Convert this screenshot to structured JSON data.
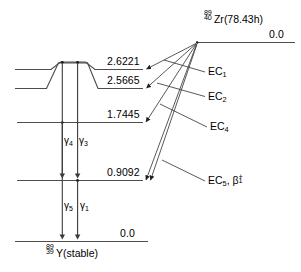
{
  "diagram": {
    "type": "nuclear-decay-scheme",
    "parent": {
      "mass_number": "89",
      "atomic_number": "40",
      "symbol": "Zr",
      "detail": "(78.43h)",
      "energy": "0.0"
    },
    "daughter": {
      "mass_number": "89",
      "atomic_number": "39",
      "symbol": "Y",
      "detail": "(stable)",
      "energy": "0.0"
    },
    "levels": [
      {
        "id": "lvl-2-6221",
        "energy": "2.6221"
      },
      {
        "id": "lvl-2-5665",
        "energy": "2.5665"
      },
      {
        "id": "lvl-1-7445",
        "energy": "1.7445"
      },
      {
        "id": "lvl-0-9092",
        "energy": "0.9092"
      }
    ],
    "transitions": [
      {
        "id": "ec1",
        "base": "EC",
        "sub": "1"
      },
      {
        "id": "ec2",
        "base": "EC",
        "sub": "2"
      },
      {
        "id": "ec4",
        "base": "EC",
        "sub": "4"
      },
      {
        "id": "ec5",
        "base": "EC",
        "sub": "5",
        "beta_sub": "1",
        "beta_sup": "+",
        "separator": ", "
      }
    ],
    "gammas": [
      {
        "id": "g4",
        "symbol": "γ",
        "sub": "4"
      },
      {
        "id": "g3",
        "symbol": "γ",
        "sub": "3"
      },
      {
        "id": "g5",
        "symbol": "γ",
        "sub": "5"
      },
      {
        "id": "g1",
        "symbol": "γ",
        "sub": "1"
      }
    ],
    "colors": {
      "level_line": "#4d4d4d",
      "arrow": "#3a3a3a",
      "text": "#000000",
      "background": "#ffffff"
    }
  }
}
